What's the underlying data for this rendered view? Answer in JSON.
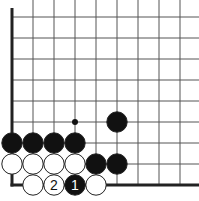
{
  "diagram": {
    "type": "go-board-fragment",
    "caption": "",
    "grid": {
      "x_lines": [
        12,
        33,
        54,
        75,
        96,
        117,
        138,
        159,
        180
      ],
      "y_lines": [
        17,
        38,
        59,
        80,
        101,
        122,
        143,
        164,
        185
      ],
      "line_color": "#555555",
      "edge_color": "#222222",
      "left_edge_x": 12,
      "bottom_edge_y": 185
    },
    "star_points": [
      {
        "x": 75,
        "y": 122
      }
    ],
    "stones": [
      {
        "color": "black",
        "x": 117,
        "y": 122,
        "label": ""
      },
      {
        "color": "black",
        "x": 12,
        "y": 143,
        "label": ""
      },
      {
        "color": "black",
        "x": 33,
        "y": 143,
        "label": ""
      },
      {
        "color": "black",
        "x": 54,
        "y": 143,
        "label": ""
      },
      {
        "color": "black",
        "x": 75,
        "y": 143,
        "label": ""
      },
      {
        "color": "white",
        "x": 12,
        "y": 164,
        "label": ""
      },
      {
        "color": "white",
        "x": 33,
        "y": 164,
        "label": ""
      },
      {
        "color": "white",
        "x": 54,
        "y": 164,
        "label": ""
      },
      {
        "color": "white",
        "x": 75,
        "y": 164,
        "label": ""
      },
      {
        "color": "black",
        "x": 96,
        "y": 164,
        "label": ""
      },
      {
        "color": "black",
        "x": 117,
        "y": 164,
        "label": ""
      },
      {
        "color": "white",
        "x": 33,
        "y": 185,
        "label": ""
      },
      {
        "color": "white",
        "x": 54,
        "y": 185,
        "label": "2"
      },
      {
        "color": "black",
        "x": 75,
        "y": 185,
        "label": "1"
      },
      {
        "color": "white",
        "x": 96,
        "y": 185,
        "label": ""
      }
    ],
    "colors": {
      "black_stone": "#111111",
      "white_stone": "#ffffff",
      "stone_outline": "#222222"
    }
  }
}
